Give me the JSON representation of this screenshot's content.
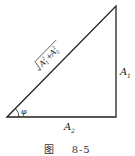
{
  "diagram": {
    "type": "right-triangle",
    "hypotenuse_label": "√(A₁²+A₂²)",
    "vertical_leg_label": "A",
    "vertical_leg_sub": "1",
    "horizontal_leg_label": "A",
    "horizontal_leg_sub": "2",
    "angle_label": "φ",
    "stroke_color": "#222222"
  },
  "caption": {
    "figure_word": "图",
    "number": "8-5"
  }
}
